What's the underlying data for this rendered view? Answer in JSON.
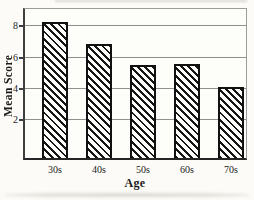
{
  "figure": {
    "background": "#fcfbf7",
    "axis_color": "#3f3f3f",
    "frame_color": "#9b9b9b",
    "grid_color": "#8f8f8f",
    "text_color": "#1b1b1b",
    "bar_fill": "#fdfdfa",
    "bar_hatch_color": "#161616",
    "bar_border_color": "#111111"
  },
  "chart_data": {
    "type": "bar",
    "categories": [
      "30s",
      "40s",
      "50s",
      "60s",
      "70s"
    ],
    "values": [
      8.3,
      6.9,
      5.5,
      5.6,
      4.1
    ],
    "title": "",
    "xlabel": "Age",
    "ylabel": "Mean Score",
    "yticks": [
      2,
      4,
      6,
      8
    ],
    "ylim": [
      -0.4,
      9.1
    ],
    "grid": true,
    "legend": null,
    "bar_hatch": "diagonal-backslash"
  }
}
